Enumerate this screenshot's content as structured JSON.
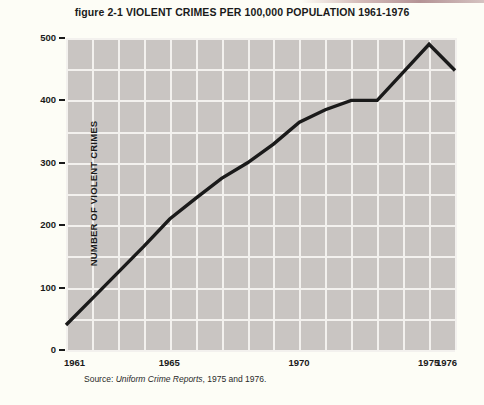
{
  "figure": {
    "title": "figure 2-1  VIOLENT CRIMES PER 100,000 POPULATION 1961-1976",
    "source_prefix": "Source: ",
    "source_italic": "Uniform Crime Reports",
    "source_suffix": ", 1975 and 1976.",
    "plot_background_color": "#c9c5c2",
    "grid_color": "#f3f1ee",
    "line_color": "#1a1a1a",
    "page_background_color": "#fdfdf6"
  },
  "chart_data": {
    "type": "line",
    "title": "figure 2-1  VIOLENT CRIMES PER 100,000 POPULATION 1961-1976",
    "xlabel": "",
    "ylabel": "NUMBER OF VIOLENT CRIMES",
    "xlim": [
      1961,
      1976
    ],
    "ylim": [
      0,
      500
    ],
    "grid": true,
    "legend": "none",
    "x": [
      1961,
      1962,
      1963,
      1964,
      1965,
      1966,
      1967,
      1968,
      1969,
      1970,
      1971,
      1972,
      1973,
      1974,
      1975,
      1976
    ],
    "values": [
      40,
      82,
      124,
      166,
      210,
      243,
      275,
      300,
      330,
      365,
      385,
      400,
      400,
      445,
      490,
      448
    ],
    "series": [
      {
        "name": "Violent crimes per 100,000 population",
        "values": [
          40,
          82,
          124,
          166,
          210,
          243,
          275,
          300,
          330,
          365,
          385,
          400,
          400,
          445,
          490,
          448
        ]
      }
    ],
    "x_tick_labels": [
      "1961",
      "1965",
      "1970",
      "1975",
      "1976"
    ],
    "x_tick_values": [
      1961,
      1965,
      1970,
      1975,
      1976
    ],
    "y_tick_labels": [
      "0",
      "100",
      "200",
      "300",
      "400",
      "500"
    ],
    "y_tick_values": [
      0,
      100,
      200,
      300,
      400,
      500
    ]
  },
  "y_axis": {
    "title": "NUMBER OF VIOLENT CRIMES",
    "ticks": [
      {
        "label": "500",
        "value": 500
      },
      {
        "label": "400",
        "value": 400
      },
      {
        "label": "300",
        "value": 300
      },
      {
        "label": "200",
        "value": 200
      },
      {
        "label": "100",
        "value": 100
      },
      {
        "label": "0",
        "value": 0
      }
    ]
  },
  "x_axis": {
    "ticks": [
      {
        "label": "1961",
        "value": 1961
      },
      {
        "label": "1965",
        "value": 1965
      },
      {
        "label": "1970",
        "value": 1970
      },
      {
        "label": "1975",
        "value": 1975
      },
      {
        "label": "1976",
        "value": 1976
      }
    ]
  }
}
